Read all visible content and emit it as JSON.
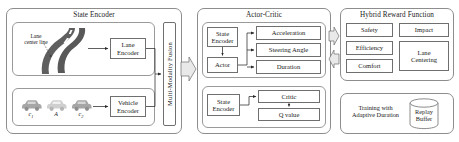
{
  "diagram": {
    "panels": {
      "state_encoder": {
        "title": "State Encoder",
        "lane_caption": "Lane\ncenter line",
        "lane_encoder": "Lane\nEncoder",
        "vehicle_encoder": "Vehicle\nEncoder",
        "vehicle_labels": [
          {
            "base": "c",
            "sub": "1"
          },
          {
            "base": "A",
            "sub": ""
          },
          {
            "base": "c",
            "sub": "2"
          }
        ],
        "fusion_label": "Multi-Modality Fusion"
      },
      "actor_critic": {
        "title": "Actor-Critic",
        "actor_block": {
          "state_encoder": "State\nEncoder",
          "actor": "Actor",
          "outputs": [
            "Acceleration",
            "Steering Angle",
            "Duration"
          ]
        },
        "critic_block": {
          "state_encoder": "State\nEncoder",
          "critic": "Critic",
          "q_value": "Q value"
        }
      },
      "hybrid_reward": {
        "title": "Hybrid Reward Function",
        "terms": [
          "Safety",
          "Impact",
          "Efficiency",
          "Lane\nCentering",
          "Comfort"
        ]
      },
      "training": {
        "label": "Training with\nAdaptive Duration",
        "replay_buffer": "Replay\nBuffer"
      }
    },
    "colors": {
      "panel_border": "#8d8d8d",
      "box_border": "#6f6f6f",
      "road": "#595959",
      "lane_marking": "#ffffff",
      "car": "#a6a6a6",
      "arrow_fill": "#e9e9e9",
      "text": "#1a1a1a"
    },
    "icons": {
      "road": "road-icon",
      "car": "car-icon",
      "block_arrow_right": "block-arrow-right-icon",
      "block_arrow_left": "block-arrow-left-icon",
      "cylinder": "database-cylinder-icon"
    }
  }
}
